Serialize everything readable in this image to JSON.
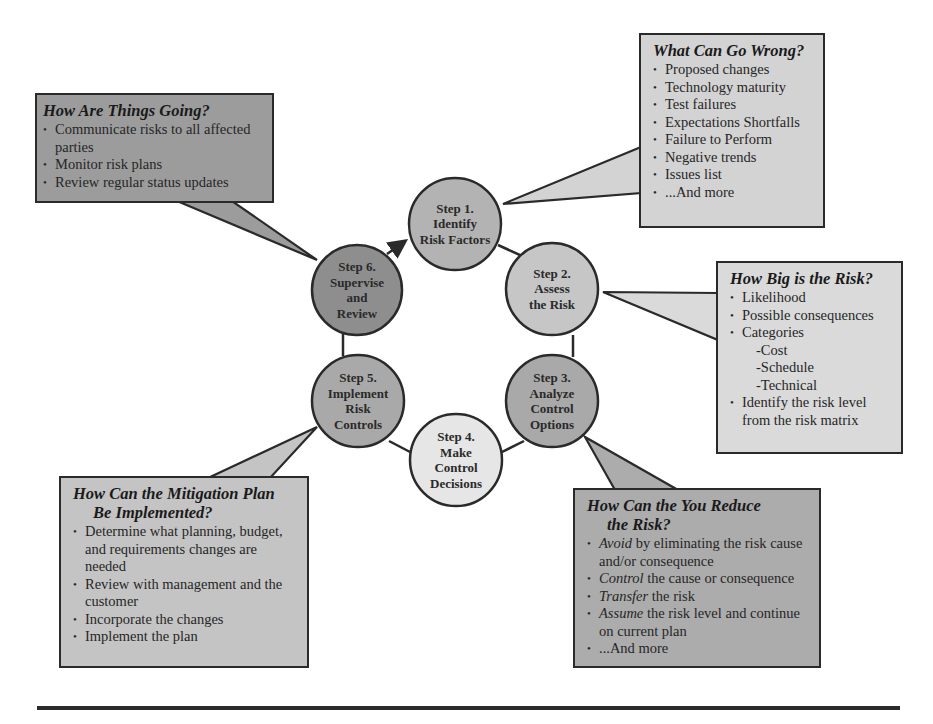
{
  "colors": {
    "outline": "#2a2a2a",
    "step1": "#b3b3b3",
    "step2": "#c6c6c6",
    "step3": "#a9a9a9",
    "step4": "#e6e6e6",
    "step5": "#a9a9a9",
    "step6": "#8e8e8e",
    "box_wrong": "#d3d3d3",
    "box_going": "#9c9c9c",
    "box_big": "#dadada",
    "box_reduce": "#acacac",
    "box_mitigation": "#c4c4c4",
    "rule": "#2b2b2b"
  },
  "steps": [
    {
      "id": "step1",
      "line1": "Step 1.",
      "line2": "Identify",
      "line3": "Risk Factors",
      "line4": ""
    },
    {
      "id": "step2",
      "line1": "Step 2.",
      "line2": "Assess",
      "line3": "the Risk",
      "line4": ""
    },
    {
      "id": "step3",
      "line1": "Step 3.",
      "line2": "Analyze",
      "line3": "Control",
      "line4": "Options"
    },
    {
      "id": "step4",
      "line1": "Step 4.",
      "line2": "Make",
      "line3": "Control",
      "line4": "Decisions"
    },
    {
      "id": "step5",
      "line1": "Step 5.",
      "line2": "Implement",
      "line3": "Risk",
      "line4": "Controls"
    },
    {
      "id": "step6",
      "line1": "Step 6.",
      "line2": "Supervise",
      "line3": "and",
      "line4": "Review"
    }
  ],
  "boxes": {
    "what_can_go_wrong": {
      "title": "What Can Go Wrong?",
      "items": [
        "Proposed changes",
        "Technology maturity",
        "Test failures",
        "Expectations Shortfalls",
        "Failure to Perform",
        "Negative trends",
        "Issues list",
        "...And more"
      ]
    },
    "how_are_things_going": {
      "title": "How Are Things Going?",
      "items": [
        "Communicate risks to all affected parties",
        "Monitor risk plans",
        "Review regular status updates"
      ]
    },
    "how_big_is_the_risk": {
      "title": "How Big is the Risk?",
      "items": [
        "Likelihood",
        "Possible consequences",
        "Categories"
      ],
      "subitems": [
        "-Cost",
        "-Schedule",
        "-Technical"
      ],
      "last_item": "Identify the risk level from the risk matrix"
    },
    "how_reduce": {
      "title_line1": "How Can the You Reduce",
      "title_line2": "the Risk?",
      "items": [
        {
          "em": "Avoid",
          "rest": " by eliminating the risk cause and/or consequence"
        },
        {
          "em": "Control",
          "rest": " the cause or consequence"
        },
        {
          "em": "Transfer",
          "rest": " the risk"
        },
        {
          "em": "Assume",
          "rest": " the risk level and continue on current plan"
        },
        {
          "em": "",
          "rest": "...And more"
        }
      ]
    },
    "how_mitigation": {
      "title_line1": "How Can the Mitigation Plan",
      "title_line2": "Be Implemented?",
      "items": [
        "Determine what planning, budget, and requirements changes are needed",
        "Review with management and the customer",
        "Incorporate the changes",
        "Implement the plan"
      ]
    }
  }
}
